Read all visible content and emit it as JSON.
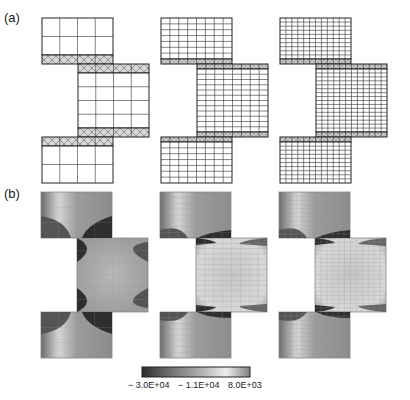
{
  "panels": [
    {
      "label": "(a)",
      "description": "Finite element meshes of the specimen at three refinement levels",
      "meshes": [
        {
          "name": "coarse",
          "cols": 4,
          "rows_top": 2,
          "rows_mid": 4,
          "rows_bottom": 2,
          "hatch": true
        },
        {
          "name": "medium",
          "cols": 8,
          "rows_top": 7,
          "rows_mid": 12,
          "rows_bottom": 7,
          "hatch": true
        },
        {
          "name": "fine",
          "cols": 12,
          "rows_top": 10,
          "rows_mid": 16,
          "rows_bottom": 10,
          "hatch": true
        }
      ]
    },
    {
      "label": "(b)",
      "description": "Stress contour plots for the three meshes"
    }
  ],
  "colorbar": {
    "labels": [
      "− 3.0E+04",
      "− 1.1E+04",
      "8.0E+03"
    ],
    "min": -30000,
    "mid": -11000,
    "max": 8000,
    "colors": [
      "#2a2a2a",
      "#9a9a9a",
      "#e6e6e6",
      "#8a8a8a"
    ]
  }
}
